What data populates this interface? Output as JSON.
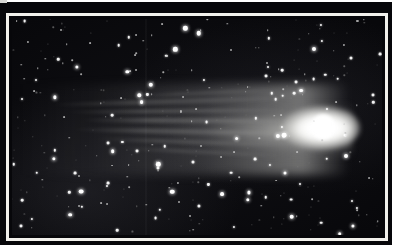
{
  "figure": {
    "kind": "astrophotograph",
    "caption": "",
    "title": "",
    "credit": "",
    "label": "",
    "colors": {
      "page_background": "#ffffff",
      "plate_mount": "#07070a",
      "keyline": "#f2f1ec",
      "sky": "#08080b",
      "star": "#ffffff",
      "coma": "#ffffff"
    },
    "frame": {
      "mount_left": 0,
      "mount_top": 2,
      "mount_width": 392,
      "mount_height": 243,
      "keyline_width_px": 3
    }
  },
  "comet": {
    "name": "",
    "coma": {
      "cx_pct": 83.5,
      "cy_pct": 50.5,
      "rx_pct": 10.5,
      "ry_pct": 10.0
    },
    "nucleus": {
      "cx_pct": 84.0,
      "cy_pct": 50.0,
      "r_pct": 3.2
    },
    "tail_direction": "left",
    "tail_extent_pct": 78,
    "streamers": [
      {
        "left_pct": 10,
        "top_pct": 37.0,
        "width_pct": 66,
        "height_pct": 2.2,
        "rotate_deg": -1.6,
        "opacity": 0.4
      },
      {
        "left_pct": 14,
        "top_pct": 41.5,
        "width_pct": 62,
        "height_pct": 2.0,
        "rotate_deg": -0.6,
        "opacity": 0.46
      },
      {
        "left_pct": 18,
        "top_pct": 46.0,
        "width_pct": 58,
        "height_pct": 2.4,
        "rotate_deg": 0.3,
        "opacity": 0.52
      },
      {
        "left_pct": 16,
        "top_pct": 51.0,
        "width_pct": 60,
        "height_pct": 2.2,
        "rotate_deg": 1.1,
        "opacity": 0.48
      },
      {
        "left_pct": 22,
        "top_pct": 56.0,
        "width_pct": 52,
        "height_pct": 2.0,
        "rotate_deg": 2.0,
        "opacity": 0.38
      },
      {
        "left_pct": 28,
        "top_pct": 60.5,
        "width_pct": 46,
        "height_pct": 1.8,
        "rotate_deg": 2.8,
        "opacity": 0.3
      },
      {
        "left_pct": 30,
        "top_pct": 33.5,
        "width_pct": 44,
        "height_pct": 1.8,
        "rotate_deg": -2.6,
        "opacity": 0.28
      }
    ]
  },
  "starfield": {
    "count_rendered": 330,
    "seam_x_pct": 36.0,
    "note": "dense field of point sources, brightest concentration toward lower left"
  }
}
